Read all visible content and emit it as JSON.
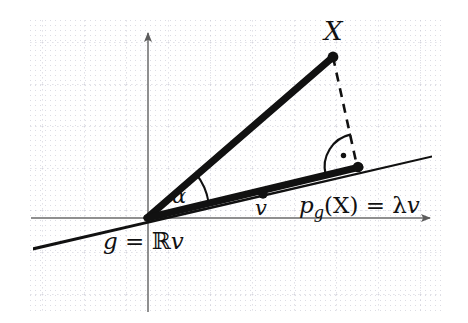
{
  "figure": {
    "width": 468,
    "height": 323,
    "background_color": "#ffffff",
    "grid": {
      "visible": true,
      "minor_dot_color": "#d9d9e0",
      "major_line_color": "#c8c8d2",
      "minor_spacing": 5,
      "major_spacing": 42,
      "left": 30,
      "top": 18,
      "right": 441,
      "bottom": 311
    }
  },
  "axes": {
    "color": "#6b6b6b",
    "origin": {
      "x": 147,
      "y": 218
    },
    "x_axis": {
      "x1": 31,
      "y1": 218,
      "x2": 437,
      "y2": 218,
      "arrow": "right"
    },
    "y_axis": {
      "x1": 148,
      "y1": 312,
      "x2": 148,
      "y2": 26,
      "arrow": "up"
    }
  },
  "lines": {
    "g_line": {
      "label_key": "g_label",
      "color": "#111111",
      "from": {
        "x": 33,
        "y": 250
      },
      "to": {
        "x": 432,
        "y": 157
      },
      "style": "solid-thick-tapered"
    },
    "vector_X": {
      "color": "#111111",
      "from": {
        "x": 147,
        "y": 218
      },
      "to": {
        "x": 333,
        "y": 57
      },
      "style": "solid-thick"
    },
    "projection_segment": {
      "color": "#111111",
      "from": {
        "x": 147,
        "y": 218
      },
      "to": {
        "x": 360,
        "y": 167
      },
      "style": "solid-thick"
    },
    "perpendicular_dashed": {
      "color": "#111111",
      "from": {
        "x": 333,
        "y": 57
      },
      "to": {
        "x": 358,
        "y": 167
      },
      "style": "dashed",
      "dash_pattern": "9 7"
    }
  },
  "points": [
    {
      "name": "point-X",
      "x": 333,
      "y": 57,
      "radius": 5.2,
      "color": "#111111"
    },
    {
      "name": "point-v",
      "x": 263,
      "y": 194,
      "radius": 4.6,
      "color": "#111111"
    },
    {
      "name": "point-projection",
      "x": 358,
      "y": 167,
      "radius": 5.0,
      "color": "#111111"
    },
    {
      "name": "point-origin",
      "x": 147,
      "y": 218,
      "radius": 0,
      "color": "#111111"
    }
  ],
  "angle_markers": {
    "alpha_arc": {
      "center": {
        "x": 147,
        "y": 218
      },
      "radius": 62,
      "color": "#111111",
      "description": "arc between vector X and the g line"
    },
    "right_angle": {
      "center": {
        "x": 358,
        "y": 167
      },
      "radius": 33,
      "dot_radius": 2.6,
      "color": "#111111",
      "description": "right angle arc with center dot marking perpendicularity"
    }
  },
  "labels": {
    "X": {
      "text": "X",
      "x": 326,
      "y": 20
    },
    "alpha": {
      "text": "α",
      "x": 170,
      "y": 188
    },
    "v": {
      "text": "v",
      "x": 253,
      "y": 198
    },
    "projection_formula": {
      "p": "p",
      "subscript": "g",
      "argument": "(X)",
      "equals": " = ",
      "lambda": "λ",
      "vector": "v",
      "x": 298,
      "y": 196
    },
    "g_definition": {
      "g": "g",
      "equals": " = ",
      "reals": "ℝ",
      "vector": "v",
      "x": 102,
      "y": 231
    }
  }
}
